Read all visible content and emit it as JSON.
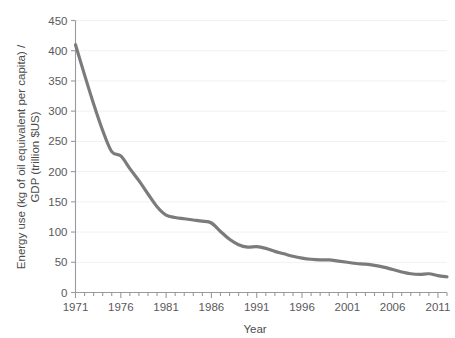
{
  "chart_data": {
    "type": "line",
    "title": "",
    "xlabel": "Year",
    "ylabel": "Energy use (kg of oil equivalent per capita) / GDP (trillion $US)",
    "ylabel_lines": [
      "Energy use (kg of oil equivalent per capita) /",
      "GDP (trillion $US)"
    ],
    "xlim": [
      1971,
      2012
    ],
    "ylim": [
      0,
      450
    ],
    "y_ticks": [
      0,
      50,
      100,
      150,
      200,
      250,
      300,
      350,
      400,
      450
    ],
    "y_tick_labels": [
      "0",
      "50",
      "100",
      "150",
      "200",
      "250",
      "300",
      "350",
      "400",
      "450"
    ],
    "x_ticks_major": [
      1971,
      1976,
      1981,
      1986,
      1991,
      1996,
      2001,
      2006,
      2011
    ],
    "x_tick_labels": [
      "1971",
      "1976",
      "1981",
      "1986",
      "1991",
      "1996",
      "2001",
      "2006",
      "2011"
    ],
    "x_minor_tick_step": 1,
    "grid": "horizontal",
    "grid_color": "#f1f1f1",
    "line_color": "#7b7b7d",
    "line_width": 3.2,
    "axis_color": "#9a9a9c",
    "text_color": "#4c4c4e",
    "series": [
      {
        "name": "Energy use per GDP",
        "x": [
          1971,
          1972,
          1973,
          1974,
          1975,
          1976,
          1977,
          1978,
          1979,
          1980,
          1981,
          1982,
          1983,
          1984,
          1985,
          1986,
          1987,
          1988,
          1989,
          1990,
          1991,
          1992,
          1993,
          1994,
          1995,
          1996,
          1997,
          1998,
          1999,
          2000,
          2001,
          2002,
          2003,
          2004,
          2005,
          2006,
          2007,
          2008,
          2009,
          2010,
          2011,
          2012
        ],
        "values": [
          410,
          360,
          312,
          268,
          233,
          226,
          205,
          185,
          163,
          142,
          128,
          124,
          122,
          120,
          118,
          115,
          101,
          88,
          79,
          75,
          76,
          73,
          68,
          64,
          60,
          57,
          55,
          54,
          54,
          52,
          50,
          48,
          47,
          45,
          42,
          38,
          34,
          31,
          30,
          31,
          28,
          26
        ]
      }
    ]
  }
}
